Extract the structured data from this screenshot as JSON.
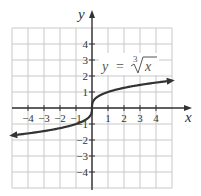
{
  "chart_data": {
    "type": "line",
    "title": "",
    "equation_label": {
      "lhs": "y",
      "eq": "=",
      "index": "3",
      "radicand": "x"
    },
    "xlabel": "x",
    "ylabel": "y",
    "xlim": [
      -5,
      5
    ],
    "ylim": [
      -5,
      5
    ],
    "grid": true,
    "x_ticks": [
      -4,
      -3,
      -2,
      -1,
      1,
      2,
      3,
      4
    ],
    "y_ticks": [
      -4,
      -3,
      -2,
      -1,
      1,
      2,
      3,
      4
    ],
    "x_tick_labels": [
      "−4",
      "−3",
      "−2",
      "−1",
      "1",
      "2",
      "3",
      "4"
    ],
    "y_tick_labels": [
      "−4",
      "−3",
      "−2",
      "−1",
      "1",
      "2",
      "3",
      "4"
    ],
    "series": [
      {
        "name": "y = cube root of x",
        "function": "cbrt(x)",
        "domain": [
          -5,
          5
        ],
        "arrows": "both",
        "points": [
          [
            -5,
            -1.71
          ],
          [
            -4,
            -1.59
          ],
          [
            -3,
            -1.44
          ],
          [
            -2,
            -1.26
          ],
          [
            -1,
            -1
          ],
          [
            -0.125,
            -0.5
          ],
          [
            0,
            0
          ],
          [
            0.125,
            0.5
          ],
          [
            1,
            1
          ],
          [
            2,
            1.26
          ],
          [
            3,
            1.44
          ],
          [
            4,
            1.59
          ],
          [
            5,
            1.71
          ]
        ]
      }
    ]
  },
  "colors": {
    "curve": "#333333",
    "axis": "#333333",
    "grid": "#c8c8c8"
  }
}
